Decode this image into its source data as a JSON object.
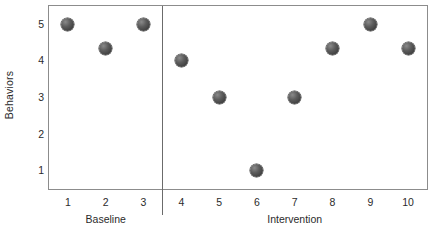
{
  "chart_data": {
    "type": "scatter",
    "title": "",
    "subtitle": "",
    "xlabel": "",
    "ylabel": "Behaviors",
    "x": [
      1,
      2,
      3,
      4,
      5,
      6,
      7,
      8,
      9,
      10
    ],
    "values": [
      5,
      4.33,
      5,
      4,
      3,
      1,
      3,
      4.33,
      5,
      4.33
    ],
    "series": [
      {
        "name": "Behaviors",
        "x": [
          1,
          2,
          3,
          4,
          5,
          6,
          7,
          8,
          9,
          10
        ],
        "values": [
          5,
          4.33,
          5,
          4,
          3,
          1,
          3,
          4.33,
          5,
          4.33
        ]
      }
    ],
    "phases": [
      {
        "label": "Baseline",
        "x_start": 1,
        "x_end": 3,
        "values": [
          5,
          4.33,
          5
        ]
      },
      {
        "label": "Intervention",
        "x_start": 4,
        "x_end": 10,
        "values": [
          4,
          3,
          1,
          3,
          4.33,
          5,
          4.33
        ]
      }
    ],
    "phase_change_x": 3.5,
    "xlim": [
      0.5,
      10.5
    ],
    "ylim": [
      0.5,
      5.5
    ],
    "x_ticks": [
      "1",
      "2",
      "3",
      "4",
      "5",
      "6",
      "7",
      "8",
      "9",
      "10"
    ],
    "y_ticks": [
      "5",
      "4",
      "3",
      "2",
      "1"
    ],
    "y_tick_values": [
      5,
      4,
      3,
      2,
      1
    ],
    "grid": false,
    "legend": false,
    "legend_position": "none",
    "marker_color": "#4a4a4a",
    "axis_color": "#8c8c8c",
    "background_color": "#ffffff",
    "text_color": "#2b2b2b"
  },
  "axes": {
    "y_title": "Behaviors"
  },
  "phase_labels": {
    "baseline": "Baseline",
    "intervention": "Intervention"
  }
}
